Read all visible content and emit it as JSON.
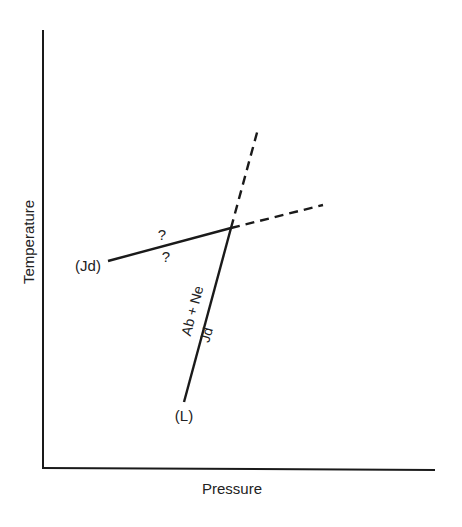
{
  "diagram": {
    "type": "phase-diagram",
    "axes": {
      "x_label": "Pressure",
      "y_label": "Temperature"
    },
    "reactions": [
      {
        "name": "Ab + Ne = Jd",
        "label_upper": "Ab + Ne",
        "label_lower": "Jd",
        "solid_segment": {
          "from": [
            184,
            402
          ],
          "to": [
            231,
            228
          ]
        },
        "dashed_extension": {
          "from": [
            231,
            228
          ],
          "to": [
            258,
            129
          ]
        },
        "end_label": "(L)"
      },
      {
        "name": "Jd-absent reaction",
        "solid_segment": {
          "from": [
            108,
            261
          ],
          "to": [
            231,
            228
          ]
        },
        "dashed_extension": {
          "from": [
            231,
            228
          ],
          "to": [
            323,
            205
          ]
        },
        "end_label": "(Jd)",
        "annotations": [
          "?",
          "?"
        ]
      }
    ],
    "invariant_point": [
      231,
      228
    ],
    "colors": {
      "line": "#1a1a1a",
      "text": "#222222",
      "background": "#ffffff"
    }
  }
}
